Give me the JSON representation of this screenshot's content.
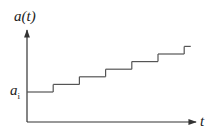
{
  "chart_data": {
    "type": "line",
    "style": "step",
    "title": "",
    "ylabel": "a(t)",
    "xlabel": "t",
    "ytick_label": {
      "base": "a",
      "subscript": "i"
    },
    "steps": [
      {
        "level": 0,
        "t_start": 0,
        "t_end": 1
      },
      {
        "level": 1,
        "t_start": 1,
        "t_end": 2
      },
      {
        "level": 2,
        "t_start": 2,
        "t_end": 3
      },
      {
        "level": 3,
        "t_start": 3,
        "t_end": 4
      },
      {
        "level": 4,
        "t_start": 4,
        "t_end": 5
      },
      {
        "level": 5,
        "t_start": 5,
        "t_end": 6
      },
      {
        "level": 6,
        "t_start": 6,
        "t_end": 6.25
      }
    ],
    "xlim": [
      0,
      6.5
    ],
    "ylim": [
      -3.6,
      6.8
    ],
    "grid": false,
    "legend": "none",
    "line_color": "#555555",
    "axis_color": "#333333"
  }
}
